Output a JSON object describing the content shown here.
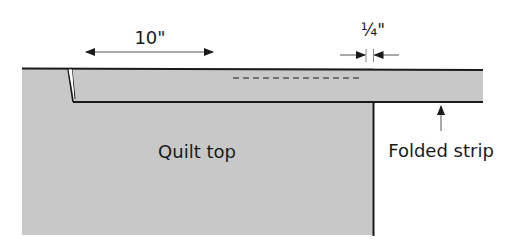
{
  "diagram": {
    "colors": {
      "fabric_fill": "#c8c8c8",
      "outline": "#1a1a1a",
      "background": "#ffffff"
    },
    "labels": {
      "width_measure": "10\"",
      "seam_allowance": "¼\"",
      "quilt_top": "Quilt top",
      "folded_strip": "Folded strip"
    }
  }
}
